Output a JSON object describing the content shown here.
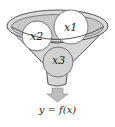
{
  "diagram": {
    "type": "funnel",
    "inputs": [
      {
        "id": "x1",
        "label": "x1"
      },
      {
        "id": "x2",
        "label": "x2"
      },
      {
        "id": "x3",
        "label": "x3"
      }
    ],
    "output": {
      "label": "y = f(x)"
    },
    "colors": {
      "funnel_fill": "#d9d9d9",
      "funnel_inner": "#c4c4c4",
      "funnel_stroke": "#555555",
      "circle_fill": "#ffffff",
      "circle_submerged": "#d2d2d2",
      "arrow_fill": "#bdbdbd"
    }
  }
}
